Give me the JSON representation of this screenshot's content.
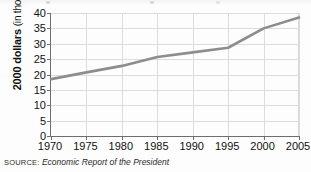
{
  "chart_data": {
    "type": "line",
    "title": "",
    "subtitle": "",
    "xlabel": "",
    "ylabel": "2000 dollars (in thousands)",
    "ylabel_bold_part": "2000 dollars",
    "ylabel_light_part": "(in thousands)",
    "x": [
      1970,
      1975,
      1980,
      1985,
      1990,
      1995,
      2000,
      2005
    ],
    "xtick_labels": [
      "1970",
      "1975",
      "1980",
      "1985",
      "1990",
      "1995",
      "2000",
      "2005"
    ],
    "ytick_labels": [
      "0",
      "5",
      "10",
      "15",
      "20",
      "25",
      "30",
      "35",
      "40"
    ],
    "ytick_values": [
      0,
      5,
      10,
      15,
      20,
      25,
      30,
      35,
      40
    ],
    "xlim": [
      1970,
      2005
    ],
    "ylim": [
      0,
      40
    ],
    "grid": "both",
    "legend": "none",
    "series": [
      {
        "name": "Median income",
        "color": "#8d8d8d",
        "values": [
          18.5,
          20.7,
          22.8,
          25.7,
          27.2,
          28.7,
          35.0,
          38.5
        ]
      }
    ]
  },
  "source": {
    "label": "SOURCE:",
    "text": "Economic Report of the President"
  },
  "colors": {
    "line": "#8d8d8d",
    "axis": "#6e6e6e",
    "grid": "#dcdcdc",
    "text": "#111111",
    "background": "#fdfdfd"
  }
}
